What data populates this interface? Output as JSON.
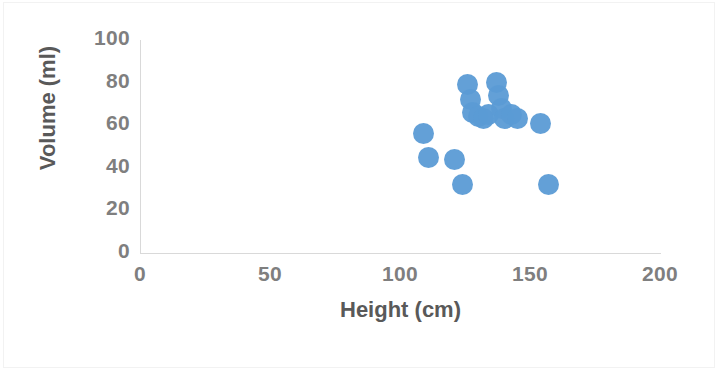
{
  "chart_data": {
    "type": "scatter",
    "title": "",
    "xlabel": "Height (cm)",
    "ylabel": "Volume (ml)",
    "xlim": [
      0,
      200
    ],
    "ylim": [
      0,
      100
    ],
    "xticks": [
      "0",
      "50",
      "100",
      "150",
      "200"
    ],
    "yticks": [
      "0",
      "20",
      "40",
      "60",
      "80",
      "100"
    ],
    "grid": false,
    "legend": false,
    "marker_color": "#5B9BD5",
    "axis_color": "#D9D9D9",
    "tick_label_color": "#7F7F7F",
    "axis_title_color": "#595959",
    "series": [
      {
        "name": "Volume vs Height",
        "points": [
          {
            "x": 109,
            "y": 56
          },
          {
            "x": 111,
            "y": 45
          },
          {
            "x": 121,
            "y": 44
          },
          {
            "x": 124,
            "y": 32
          },
          {
            "x": 126,
            "y": 79
          },
          {
            "x": 127,
            "y": 72
          },
          {
            "x": 128,
            "y": 66
          },
          {
            "x": 130,
            "y": 64
          },
          {
            "x": 132,
            "y": 63
          },
          {
            "x": 134,
            "y": 65
          },
          {
            "x": 137,
            "y": 80
          },
          {
            "x": 138,
            "y": 74
          },
          {
            "x": 139,
            "y": 68
          },
          {
            "x": 140,
            "y": 63
          },
          {
            "x": 143,
            "y": 65
          },
          {
            "x": 145,
            "y": 63
          },
          {
            "x": 154,
            "y": 61
          },
          {
            "x": 157,
            "y": 32
          }
        ]
      }
    ]
  }
}
